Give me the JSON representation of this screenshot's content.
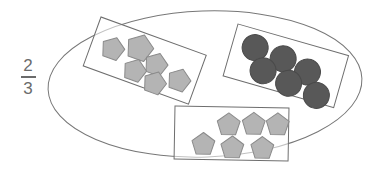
{
  "canvas": {
    "width": 387,
    "height": 170,
    "background": "#ffffff"
  },
  "label": {
    "name": "fraction-label",
    "text": "2/3",
    "numerator": "2",
    "denominator": "3",
    "color": "#6b6b6b"
  },
  "colors": {
    "outline": "#6e6e6e",
    "pentagon_fill": "#b4b4b4",
    "pentagon_stroke": "#8a8a8a",
    "circle_fill": "#585858",
    "circle_stroke": "#4a4a4a",
    "rectangle_stroke": "#6e6e6e",
    "ellipse_stroke": "#777777"
  },
  "ellipse": {
    "name": "set-ellipse",
    "cx": 205,
    "cy": 84,
    "rx": 157,
    "ry": 73,
    "rotation": -2
  },
  "groups": [
    {
      "name": "group-pentagons-top-left",
      "shape_type": "pentagon",
      "count": 6,
      "fill": "#b4b4b4",
      "rect": {
        "x": 101,
        "y": 17,
        "width": 112,
        "height": 52,
        "rotation": 20
      },
      "items": [
        {
          "cx": 22,
          "cy": 26,
          "r": 12
        },
        {
          "cx": 47,
          "cy": 16,
          "r": 14
        },
        {
          "cx": 68,
          "cy": 26,
          "r": 12
        },
        {
          "cx": 50,
          "cy": 39,
          "r": 12
        },
        {
          "cx": 73,
          "cy": 44,
          "r": 12
        },
        {
          "cx": 95,
          "cy": 33,
          "r": 12
        }
      ]
    },
    {
      "name": "group-circles-right",
      "shape_type": "circle",
      "count": 6,
      "fill": "#585858",
      "rect": {
        "x": 238,
        "y": 24,
        "width": 115,
        "height": 54,
        "rotation": 16
      },
      "items": [
        {
          "cx": 23,
          "cy": 18,
          "r": 13
        },
        {
          "cx": 53,
          "cy": 21,
          "r": 13
        },
        {
          "cx": 37,
          "cy": 38,
          "r": 13
        },
        {
          "cx": 80,
          "cy": 27,
          "r": 13
        },
        {
          "cx": 65,
          "cy": 43,
          "r": 13
        },
        {
          "cx": 95,
          "cy": 47,
          "r": 13
        }
      ]
    },
    {
      "name": "group-pentagons-bottom",
      "shape_type": "pentagon",
      "count": 6,
      "fill": "#b4b4b4",
      "rect": {
        "x": 175,
        "y": 106,
        "width": 114,
        "height": 53,
        "rotation": 1
      },
      "items": [
        {
          "cx": 29,
          "cy": 38,
          "r": 12
        },
        {
          "cx": 54,
          "cy": 18,
          "r": 12
        },
        {
          "cx": 58,
          "cy": 41,
          "r": 12
        },
        {
          "cx": 79,
          "cy": 17,
          "r": 12
        },
        {
          "cx": 88,
          "cy": 41,
          "r": 12
        },
        {
          "cx": 103,
          "cy": 17,
          "r": 12
        }
      ]
    }
  ]
}
